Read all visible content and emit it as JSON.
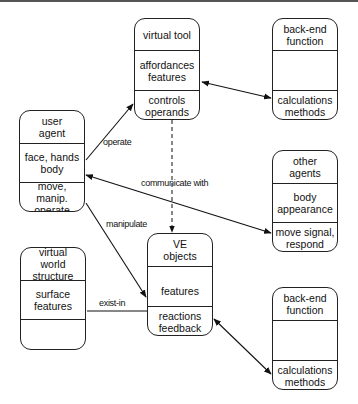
{
  "boxes": {
    "virtual_tool": {
      "title": "virtual tool",
      "attributes": "affordances features",
      "operations": "controls operands"
    },
    "backend_top": {
      "title": "back-end function",
      "attributes": "",
      "operations": "calculations methods"
    },
    "user_agent": {
      "title": "user agent",
      "attributes": "face, hands body",
      "operations": "move, manip. operate"
    },
    "other_agents": {
      "title": "other agents",
      "attributes": "body appearance",
      "operations": "move signal, respond"
    },
    "ve_objects": {
      "title": "VE objects",
      "attributes": "features",
      "operations": "reactions feedback"
    },
    "virtual_world": {
      "title": "virtual world structure",
      "attributes": "surface features",
      "operations": ""
    },
    "backend_bottom": {
      "title": "back-end function",
      "attributes": "",
      "operations": "calculations methods"
    }
  },
  "relations": {
    "operate": "operate",
    "communicate_with": "communicate with",
    "manipulate": "manipulate",
    "exist_in": "exist-in"
  }
}
